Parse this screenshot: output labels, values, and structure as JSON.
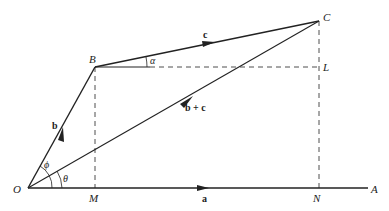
{
  "diagram": {
    "points": {
      "O": {
        "label": "O",
        "x": 28,
        "y": 188
      },
      "B": {
        "label": "B",
        "x": 95,
        "y": 67
      },
      "C": {
        "label": "C",
        "x": 319,
        "y": 21
      },
      "L": {
        "label": "L",
        "x": 319,
        "y": 67
      },
      "M": {
        "label": "M",
        "x": 95,
        "y": 188
      },
      "N": {
        "label": "N",
        "x": 319,
        "y": 188
      },
      "A": {
        "label": "A",
        "x": 368,
        "y": 188
      }
    },
    "vectors": {
      "a": "a",
      "b": "b",
      "c": "c",
      "b_plus_c": "b + c"
    },
    "angles": {
      "alpha": "α",
      "phi": "ϕ",
      "theta": "θ"
    },
    "colors": {
      "stroke": "#222222",
      "background": "#ffffff"
    }
  }
}
